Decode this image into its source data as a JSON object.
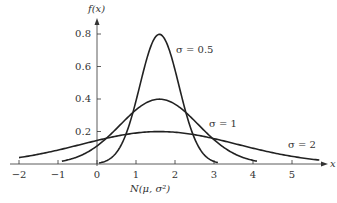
{
  "chart_data": {
    "type": "line",
    "title": "",
    "xlabel": "x",
    "ylabel": "f(x)",
    "caption": "N(μ, σ²)",
    "mean": 1.6,
    "xlim": [
      -2,
      5.7
    ],
    "ylim": [
      0,
      0.85
    ],
    "x_ticks": [
      "−2",
      "−1",
      "0",
      "1",
      "2",
      "3",
      "4",
      "5"
    ],
    "y_ticks": [
      "0.2",
      "0.4",
      "0.6",
      "0.8"
    ],
    "grid": false,
    "series": [
      {
        "name": "σ = 0.5",
        "sigma": 0.5,
        "peak": 0.8,
        "x_range": [
          0.05,
          3.1
        ]
      },
      {
        "name": "σ = 1",
        "sigma": 1,
        "peak": 0.4,
        "x_range": [
          -0.9,
          4.1
        ]
      },
      {
        "name": "σ = 2",
        "sigma": 2,
        "peak": 0.2,
        "x_range": [
          -2,
          5.7
        ]
      }
    ],
    "annotations": [
      {
        "text": "σ = 0.5",
        "x": 2.3,
        "y": 0.76
      },
      {
        "text": "σ = 1",
        "x": 2.9,
        "y": 0.24
      },
      {
        "text": "σ = 2",
        "x": 4.9,
        "y": 0.12
      }
    ]
  }
}
